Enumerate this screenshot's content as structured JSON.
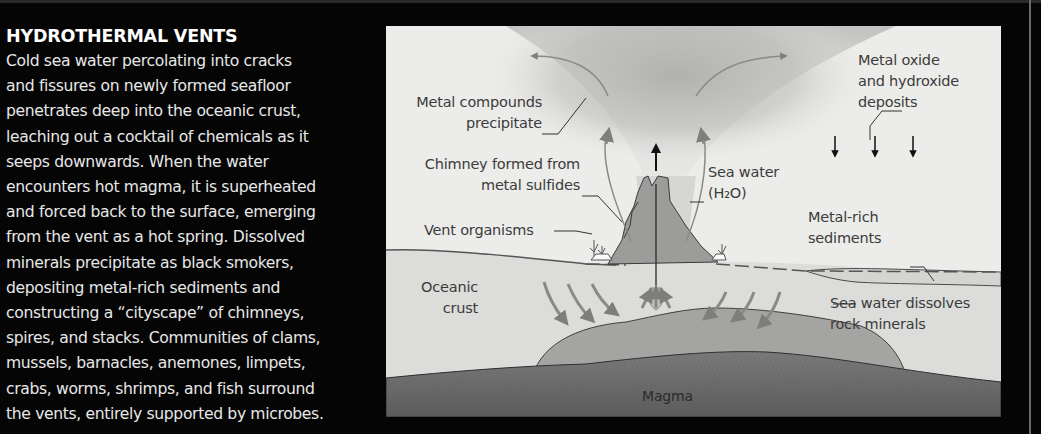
{
  "article": {
    "heading": "HYDROTHERMAL VENTS",
    "body_lines": [
      "Cold sea water percolating into cracks",
      "and fissures on newly formed seafloor",
      "penetrates deep into the oceanic crust,",
      "leaching out a cocktail of chemicals as it",
      "seeps downwards. When the water",
      "encounters hot magma, it is superheated",
      "and forced back to the surface, emerging",
      "from the vent as a hot spring. Dissolved",
      "minerals precipitate as black smokers,",
      "depositing metal-rich sediments and",
      "constructing a “cityscape” of chimneys,",
      "spires, and stacks. Communities of clams,",
      "mussels, barnacles, anemones, limpets,",
      "crabs, worms, shrimps, and fish surround",
      "the vents, entirely supported by microbes."
    ]
  },
  "diagram": {
    "labels": {
      "metal_compounds": [
        "Metal compounds",
        "precipitate"
      ],
      "chimney": [
        "Chimney formed from",
        "metal sulfides"
      ],
      "vent_organisms": "Vent organisms",
      "sea_water": [
        "Sea water",
        "(H₂O)"
      ],
      "metal_oxide": [
        "Metal oxide",
        "and hydroxide",
        "deposits"
      ],
      "metal_rich": [
        "Metal-rich",
        "sediments"
      ],
      "oceanic_crust": [
        "Oceanic",
        "crust"
      ],
      "sea_water_dissolves": [
        "Sea water dissolves",
        "rock minerals"
      ],
      "magma": "Magma"
    },
    "colors": {
      "background": "#ececea",
      "plume": "#b4b4b2",
      "crust": "#dcdcda",
      "hot_rock": "#9a9a98",
      "magma": "#6c6c6c",
      "chimney": "#9c9c9a",
      "arrow_gray": "#8a8a88",
      "arrow_black": "#111111",
      "text": "#3b3b3b"
    }
  }
}
